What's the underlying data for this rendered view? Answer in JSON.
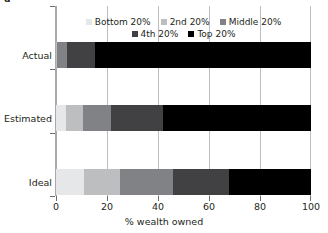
{
  "chart_data": {
    "type": "bar",
    "orientation": "horizontal",
    "stacked": true,
    "stack_mode": "percent",
    "title": "",
    "xlabel": "% wealth owned",
    "ylabel": "",
    "xlim": [
      0,
      100
    ],
    "xticks": [
      "0",
      "20",
      "40",
      "60",
      "80",
      "100"
    ],
    "xtick_values": [
      0,
      20,
      40,
      60,
      80,
      100
    ],
    "grid": "vertical",
    "legend_position": "top-inside",
    "categories": [
      "Actual",
      "Estimated",
      "Ideal"
    ],
    "series": [
      {
        "name": "Bottom 20%",
        "color": "#e6e7e8",
        "values": [
          0.1,
          4.0,
          11.0
        ]
      },
      {
        "name": "2nd 20%",
        "color": "#bcbec0",
        "values": [
          0.2,
          6.5,
          14.0
        ]
      },
      {
        "name": "Middle 20%",
        "color": "#808285",
        "values": [
          4.0,
          11.0,
          21.0
        ]
      },
      {
        "name": "4th 20%",
        "color": "#414042",
        "values": [
          11.0,
          20.5,
          22.0
        ]
      },
      {
        "name": "Top 20%",
        "color": "#000000",
        "values": [
          84.7,
          58.0,
          32.0
        ]
      }
    ],
    "legend_rows": [
      [
        "Bottom 20%",
        "2nd 20%",
        "Middle 20%"
      ],
      [
        "4th 20%",
        "Top 20%"
      ]
    ]
  },
  "axis": {
    "x_title": "% wealth owned",
    "x_tick_labels": [
      "0",
      "20",
      "40",
      "60",
      "80",
      "100"
    ],
    "y_tick_labels": [
      "Actual",
      "Estimated",
      "Ideal"
    ]
  },
  "colors": {
    "gridline": "#bcbec0",
    "axis": "#a7a9ac",
    "tick": "#6d6e71",
    "text": "#231f20",
    "background": "#ffffff"
  },
  "title_sliver": "g"
}
